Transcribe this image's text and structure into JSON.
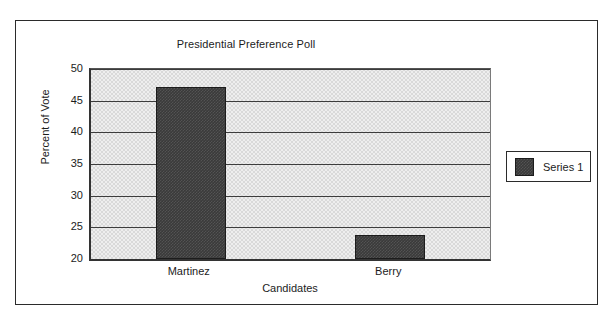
{
  "chart_data": {
    "type": "bar",
    "title": "Presidential Preference Poll",
    "xlabel": "Candidates",
    "ylabel": "Percent of Vote",
    "categories": [
      "Martinez",
      "Berry"
    ],
    "series": [
      {
        "name": "Series 1",
        "values": [
          47.2,
          23.8
        ]
      }
    ],
    "ylim": [
      20,
      50
    ],
    "ytick_step": 5,
    "yticks": [
      20,
      25,
      30,
      35,
      40,
      45,
      50
    ],
    "ytick_labels": [
      "20",
      "25",
      "30",
      "35",
      "40",
      "45",
      "50"
    ],
    "grid": true,
    "legend_position": "right",
    "legend_entries": [
      "Series 1"
    ],
    "bar_color": "#3a3a3a",
    "plot_background": "#d9d9d9",
    "gridline_color": "#3c3c3c",
    "axis_color": "#333333",
    "frame_color": "#2b2b2b"
  }
}
